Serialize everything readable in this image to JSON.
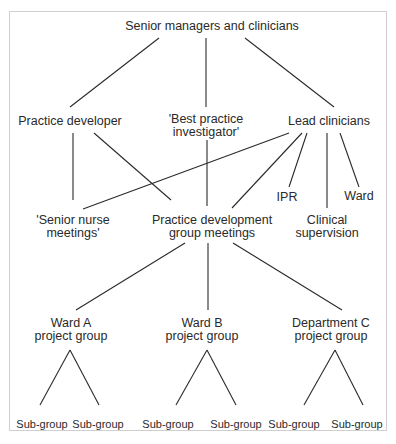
{
  "diagram": {
    "title": "",
    "nodes": {
      "root": {
        "lines": [
          "Senior managers and clinicians"
        ]
      },
      "practice_developer": {
        "lines": [
          "Practice developer"
        ]
      },
      "best_practice": {
        "lines": [
          "'Best practice",
          "investigator'"
        ]
      },
      "lead_clinicians": {
        "lines": [
          "Lead clinicians"
        ]
      },
      "ipr": {
        "lines": [
          "IPR"
        ]
      },
      "ward": {
        "lines": [
          "Ward"
        ]
      },
      "senior_nurse": {
        "lines": [
          "'Senior nurse",
          "meetings'"
        ]
      },
      "pd_group": {
        "lines": [
          "Practice development",
          "group meetings"
        ]
      },
      "clinical_supervision": {
        "lines": [
          "Clinical",
          "supervision"
        ]
      },
      "ward_a": {
        "lines": [
          "Ward A",
          "project group"
        ]
      },
      "ward_b": {
        "lines": [
          "Ward B",
          "project group"
        ]
      },
      "dept_c": {
        "lines": [
          "Department C",
          "project group"
        ]
      },
      "sub": {
        "label": "Sub-group"
      }
    },
    "edges": [
      [
        "root",
        "practice_developer"
      ],
      [
        "root",
        "best_practice"
      ],
      [
        "root",
        "lead_clinicians"
      ],
      [
        "practice_developer",
        "senior_nurse"
      ],
      [
        "practice_developer",
        "pd_group"
      ],
      [
        "best_practice",
        "pd_group"
      ],
      [
        "lead_clinicians",
        "senior_nurse"
      ],
      [
        "lead_clinicians",
        "pd_group"
      ],
      [
        "lead_clinicians",
        "ipr"
      ],
      [
        "lead_clinicians",
        "clinical_supervision"
      ],
      [
        "lead_clinicians",
        "ward"
      ],
      [
        "pd_group",
        "ward_a"
      ],
      [
        "pd_group",
        "ward_b"
      ],
      [
        "pd_group",
        "dept_c"
      ],
      [
        "ward_a",
        "sub-group-1"
      ],
      [
        "ward_a",
        "sub-group-2"
      ],
      [
        "ward_b",
        "sub-group-3"
      ],
      [
        "ward_b",
        "sub-group-4"
      ],
      [
        "dept_c",
        "sub-group-5"
      ],
      [
        "dept_c",
        "sub-group-6"
      ]
    ]
  }
}
